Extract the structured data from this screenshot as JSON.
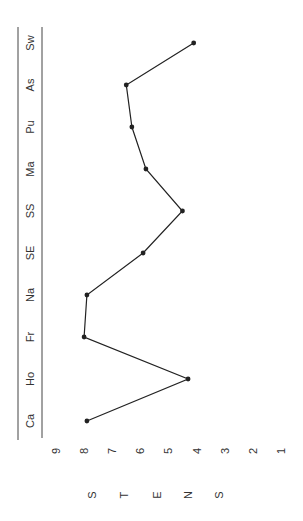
{
  "chart_data": {
    "type": "line",
    "orientation": "rotated-90-clockwise",
    "title": "",
    "xlabel": "",
    "ylabel": "STENS",
    "ylabel_letters": [
      "S",
      "T",
      "E",
      "N",
      "S"
    ],
    "categories": [
      "Ca",
      "Ho",
      "Fr",
      "Na",
      "SE",
      "SS",
      "Ma",
      "Pu",
      "As",
      "Sw"
    ],
    "values": [
      7.9,
      4.3,
      8.0,
      7.9,
      5.9,
      4.5,
      5.8,
      6.3,
      6.5,
      4.1
    ],
    "y_ticks": [
      9,
      8,
      7,
      6,
      5,
      4,
      3,
      2,
      1
    ],
    "ylim": [
      1,
      9
    ],
    "grid": false,
    "legend": null,
    "line_color": "#222222",
    "marker": "circle"
  }
}
